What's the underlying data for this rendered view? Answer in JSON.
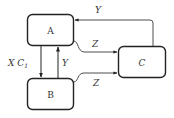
{
  "diagram": {
    "nodes": [
      {
        "id": "A",
        "label": "A"
      },
      {
        "id": "B",
        "label": "B"
      },
      {
        "id": "C",
        "label": "C"
      }
    ],
    "edges": [
      {
        "from": "A",
        "to": "B",
        "label": "X C",
        "subscript": "1"
      },
      {
        "from": "B",
        "to": "A",
        "label": "Y"
      },
      {
        "from": "A",
        "to": "C",
        "label": "Z"
      },
      {
        "from": "B",
        "to": "C",
        "label": "Z"
      },
      {
        "from": "C",
        "to": "A",
        "label": "Y"
      }
    ]
  }
}
